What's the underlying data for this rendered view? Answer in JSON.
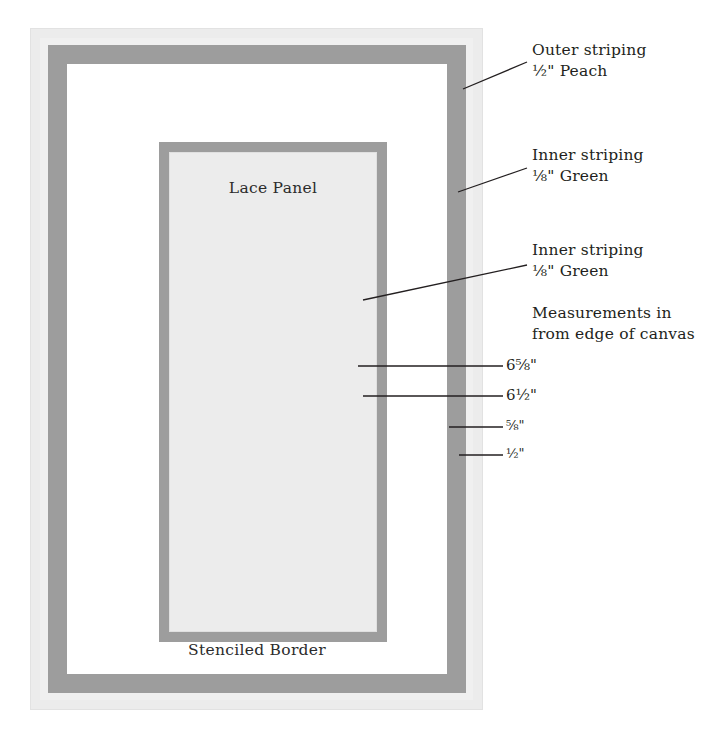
{
  "diagram": {
    "canvas": {
      "lace_panel_label": "Lace Panel",
      "stenciled_border_label": "Stenciled Border"
    },
    "colors": {
      "page_background": "#ffffff",
      "canvas_fill": "#ececec",
      "stripe_grey": "#9d9d9d",
      "panel_fill": "#ececec",
      "text": "#231f20",
      "leader_line": "#231f20"
    },
    "annotations": [
      {
        "name": "outer-striping",
        "line1": "Outer striping",
        "line2": "½\" Peach",
        "width_in": 0.5,
        "color_name": "Peach"
      },
      {
        "name": "inner-striping-upper",
        "line1": "Inner striping",
        "line2": "⅛\" Green",
        "width_in": 0.125,
        "color_name": "Green"
      },
      {
        "name": "inner-striping-lower",
        "line1": "Inner striping",
        "line2": "⅛\" Green",
        "width_in": 0.125,
        "color_name": "Green"
      },
      {
        "name": "measurements-note",
        "line1": "Measurements in",
        "line2": "from edge of canvas"
      }
    ],
    "measurements": [
      {
        "name": "lace-panel-outer",
        "label": "6⅝\"",
        "value_in": 6.625
      },
      {
        "name": "lace-panel-inner",
        "label": "6½\"",
        "value_in": 6.5
      },
      {
        "name": "outer-stripe-inner",
        "label": "⅝\"",
        "value_in": 0.625
      },
      {
        "name": "outer-stripe-outer",
        "label": "½\"",
        "value_in": 0.5
      }
    ]
  }
}
